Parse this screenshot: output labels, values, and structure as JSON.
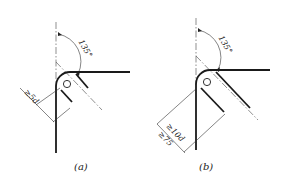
{
  "figure": {
    "panels": [
      {
        "id": "a",
        "caption": "(a)",
        "angle_label": "135°",
        "dimension_label": "≥5d",
        "description": "Bent bar hook with 135° bend around pin; straight extension length at least 5d"
      },
      {
        "id": "b",
        "caption": "(b)",
        "angle_label": "135°",
        "dimension_labels": [
          "≥10d",
          "≥75"
        ],
        "description": "Bent bar hook with 135° bend around pin; straight extension length at least 10d and at least 75"
      }
    ]
  }
}
